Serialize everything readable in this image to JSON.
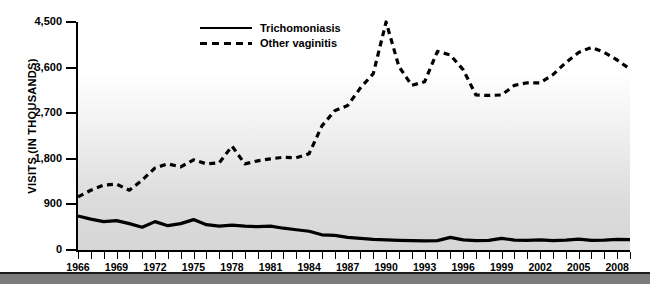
{
  "chart_data": {
    "type": "line",
    "title": "",
    "subtitle": "",
    "xlabel": "",
    "ylabel": "VISITS (IN THOUSANDS)",
    "xlim": [
      1966,
      2009
    ],
    "ylim": [
      0,
      4500
    ],
    "grid": false,
    "legend_position": "top-center",
    "y_ticks": [
      0,
      900,
      1800,
      2700,
      3600,
      4500
    ],
    "y_tick_labels": [
      "0",
      "900",
      "1,800",
      "2,700",
      "3,600",
      "4,500"
    ],
    "x_ticks": [
      1966,
      1969,
      1972,
      1975,
      1978,
      1981,
      1984,
      1987,
      1990,
      1993,
      1996,
      1999,
      2002,
      2005,
      2008
    ],
    "x_tick_labels": [
      "1966",
      "1969",
      "1972",
      "1975",
      "1978",
      "1981",
      "1984",
      "1987",
      "1990",
      "1993",
      "1996",
      "1999",
      "2002",
      "2005",
      "2008"
    ],
    "x": [
      1966,
      1967,
      1968,
      1969,
      1970,
      1971,
      1972,
      1973,
      1974,
      1975,
      1976,
      1977,
      1978,
      1979,
      1980,
      1981,
      1982,
      1983,
      1984,
      1985,
      1986,
      1987,
      1988,
      1989,
      1990,
      1991,
      1992,
      1993,
      1994,
      1995,
      1996,
      1997,
      1998,
      1999,
      2000,
      2001,
      2002,
      2003,
      2004,
      2005,
      2006,
      2007,
      2008,
      2009
    ],
    "series": [
      {
        "name": "Trichomoniasis",
        "style": "solid",
        "color": "#000000",
        "values": [
          670,
          610,
          560,
          580,
          520,
          450,
          560,
          480,
          520,
          600,
          500,
          470,
          490,
          470,
          460,
          470,
          430,
          400,
          370,
          300,
          290,
          250,
          230,
          210,
          200,
          190,
          185,
          180,
          185,
          250,
          200,
          185,
          190,
          230,
          195,
          190,
          200,
          185,
          195,
          215,
          190,
          195,
          210,
          205
        ]
      },
      {
        "name": "Other vaginitis",
        "style": "dashed",
        "color": "#000000",
        "values": [
          1050,
          1180,
          1280,
          1300,
          1180,
          1380,
          1620,
          1700,
          1640,
          1780,
          1700,
          1720,
          2050,
          1700,
          1760,
          1800,
          1830,
          1820,
          1900,
          2450,
          2750,
          2850,
          3200,
          3480,
          4500,
          3620,
          3250,
          3320,
          3920,
          3850,
          3560,
          3060,
          3050,
          3060,
          3250,
          3300,
          3300,
          3460,
          3700,
          3900,
          4000,
          3900,
          3750,
          3570
        ]
      }
    ],
    "annotations": []
  },
  "legend": {
    "items": [
      {
        "label": "Trichomoniasis",
        "style": "solid"
      },
      {
        "label": "Other vaginitis",
        "style": "dashed"
      }
    ]
  },
  "axes": {
    "y_title": "VISITS (IN THOUSANDS)"
  }
}
